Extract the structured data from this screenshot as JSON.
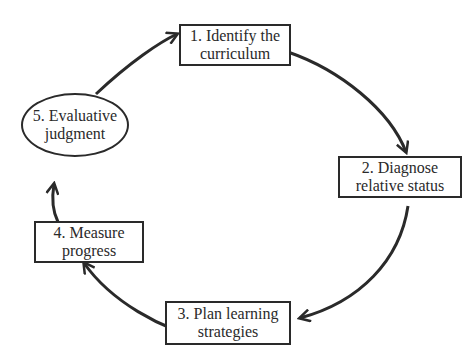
{
  "diagram": {
    "type": "cycle",
    "direction": "clockwise",
    "colors": {
      "stroke": "#2a2a2a",
      "background": "#ffffff",
      "text": "#2a2a2a"
    },
    "nodes": [
      {
        "id": "1",
        "shape": "rectangle",
        "label": "1. Identify the\ncurriculum"
      },
      {
        "id": "2",
        "shape": "rectangle",
        "label": "2. Diagnose\nrelative status"
      },
      {
        "id": "3",
        "shape": "rectangle",
        "label": "3. Plan learning\nstrategies"
      },
      {
        "id": "4",
        "shape": "rectangle",
        "label": "4. Measure\nprogress"
      },
      {
        "id": "5",
        "shape": "ellipse",
        "label": "5. Evaluative\njudgment"
      }
    ],
    "edges": [
      {
        "from": "1",
        "to": "2"
      },
      {
        "from": "2",
        "to": "3"
      },
      {
        "from": "3",
        "to": "4"
      },
      {
        "from": "4",
        "to": "5"
      },
      {
        "from": "5",
        "to": "1"
      }
    ]
  }
}
